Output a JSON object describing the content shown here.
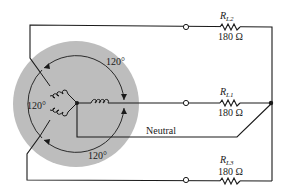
{
  "diagram": {
    "type": "three-phase Y-connected generator with balanced Y load",
    "generator": {
      "fill_color": "#bdbdbd",
      "angle_labels": [
        "120°",
        "120°",
        "120°"
      ]
    },
    "neutral_label": "Neutral",
    "loads": [
      {
        "id": "RL2",
        "symbol": "R",
        "subscript": "L2",
        "value": "180 Ω"
      },
      {
        "id": "RL1",
        "symbol": "R",
        "subscript": "L1",
        "value": "180 Ω"
      },
      {
        "id": "RL3",
        "symbol": "R",
        "subscript": "L3",
        "value": "180 Ω"
      }
    ]
  }
}
